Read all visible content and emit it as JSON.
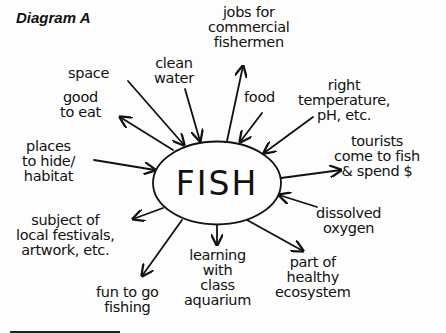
{
  "diagram": {
    "title": "Diagram A",
    "center_label": "FISH",
    "line_color": "#111111",
    "nodes": [
      {
        "id": "jobs",
        "label": "jobs for\ncommercial\nfishermen",
        "arrow": "outward"
      },
      {
        "id": "clean-water",
        "label": "clean\nwater",
        "arrow": "inward"
      },
      {
        "id": "space",
        "label": "space",
        "arrow": "inward"
      },
      {
        "id": "good-to-eat",
        "label": "good\nto eat",
        "arrow": "outward"
      },
      {
        "id": "food",
        "label": "food",
        "arrow": "inward"
      },
      {
        "id": "right-temp",
        "label": "right\ntemperature,\npH, etc.",
        "arrow": "inward"
      },
      {
        "id": "places-to-hide",
        "label": "places\nto hide/\nhabitat",
        "arrow": "inward"
      },
      {
        "id": "tourists",
        "label": "tourists\ncome to fish\n& spend $",
        "arrow": "outward"
      },
      {
        "id": "dissolved-oxygen",
        "label": "dissolved\noxygen",
        "arrow": "inward"
      },
      {
        "id": "festivals",
        "label": "subject of\nlocal festivals,\nartwork, etc.",
        "arrow": "outward"
      },
      {
        "id": "learning",
        "label": "learning\nwith\nclass\naquarium",
        "arrow": "outward"
      },
      {
        "id": "ecosystem",
        "label": "part of\nhealthy\necosystem",
        "arrow": "outward"
      },
      {
        "id": "fun-fishing",
        "label": "fun to go\nfishing",
        "arrow": "outward"
      }
    ]
  }
}
